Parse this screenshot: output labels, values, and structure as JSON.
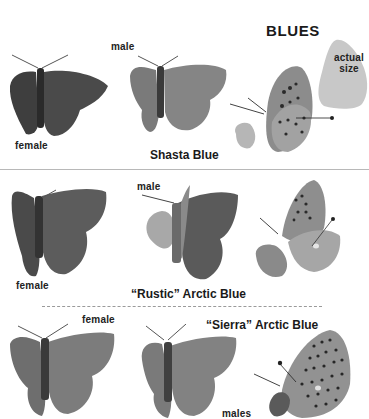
{
  "section": {
    "title": "BLUES",
    "size_marker": {
      "label_line1": "actual",
      "label_line2": "size"
    }
  },
  "species": [
    {
      "name": "Shasta Blue",
      "labels": {
        "female": "female",
        "male": "male"
      }
    },
    {
      "name": "“Rustic” Arctic Blue",
      "labels": {
        "female": "female",
        "male": "male"
      }
    },
    {
      "name": "“Sierra” Arctic Blue",
      "labels": {
        "female": "female",
        "male": "males"
      }
    }
  ],
  "colors": {
    "background": "#ffffff",
    "wing_dark": "#3e3e3e",
    "wing_mid": "#6f6f6f",
    "wing_light": "#9a9a9a",
    "silhouette": "#c8c8c8",
    "divider": "#b8b8b8"
  }
}
